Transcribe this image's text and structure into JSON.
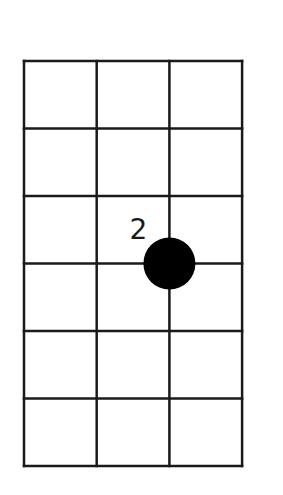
{
  "diagram": {
    "type": "chord-fret-diagram",
    "strings": 4,
    "frets": 6,
    "grid": {
      "left": 24,
      "top": 61,
      "col_width": 72.7,
      "row_height": 67.5,
      "line_color": "#1a1a1a",
      "line_width": 2.5
    },
    "dots": [
      {
        "string": 3,
        "fret_line": 3,
        "finger_label": "2",
        "color": "#000000"
      }
    ]
  }
}
